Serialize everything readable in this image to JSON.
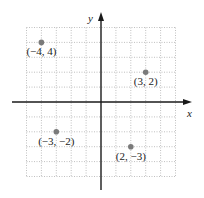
{
  "chart_data": {
    "type": "scatter",
    "title": "",
    "xlabel": "x",
    "ylabel": "y",
    "xlim": [
      -5,
      5
    ],
    "ylim": [
      -5,
      5
    ],
    "grid": true,
    "grid_style": "dotted",
    "legend": null,
    "points": [
      {
        "x": -4,
        "y": 4,
        "label": "(−4, 4)"
      },
      {
        "x": 3,
        "y": 2,
        "label": "(3, 2)"
      },
      {
        "x": -3,
        "y": -2,
        "label": "(−3, −2)"
      },
      {
        "x": 2,
        "y": -3,
        "label": "(2, −3)"
      }
    ]
  },
  "axes": {
    "x_label": "x",
    "y_label": "y"
  },
  "colors": {
    "point": "#7a7a7a",
    "axis": "#1a1a1a",
    "grid": "#b0b0b0"
  }
}
